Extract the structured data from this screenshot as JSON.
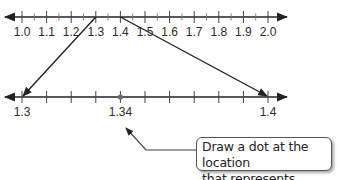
{
  "top_number_line": {
    "labels": [
      "1.0",
      "1.1",
      "1.2",
      "1.3",
      "1.4",
      "1.5",
      "1.6",
      "1.7",
      "1.8",
      "1.9",
      "2.0"
    ],
    "range": [
      1.0,
      2.0
    ],
    "major_interval": 0.1,
    "minor_interval": 0.05
  },
  "bottom_number_line": {
    "labels": {
      "start": "1.3",
      "point": "1.34",
      "end": "1.4"
    },
    "range": [
      1.3,
      1.4
    ],
    "tick_interval": 0.01,
    "marked_point": 1.34
  },
  "zoom_connectors": {
    "from": [
      "1.3",
      "1.4"
    ],
    "to": [
      "1.3",
      "1.4"
    ]
  },
  "callout": {
    "line1": "Draw a dot at the location",
    "line2": "that represents 1.34."
  },
  "colors": {
    "line": "#222222",
    "dot": "#6b6b6b",
    "callout_border": "#555555"
  }
}
